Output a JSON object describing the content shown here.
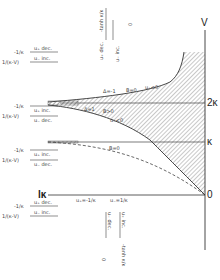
{
  "diagram": {
    "axes": {
      "v_label": "V",
      "tick_2k": "2κ",
      "tick_k": "κ",
      "tick_0": "0",
      "left_label": "lκ"
    },
    "curve_labels": {
      "upper_delta": "Δ=-1",
      "upper_b": "B=0",
      "upper_u": "u₊<0",
      "lower_delta": "Δ=1",
      "lower_b": "B>0",
      "lower_u": "u₋<0",
      "dashed_b": "B=0"
    },
    "baseline_labels": {
      "left": "u₊=-1/κ",
      "right": "u₋=1/κ"
    },
    "left_legends": [
      {
        "top_text": "u₊  dec.",
        "left_top": "-1/κ",
        "bottom_text": "u₋  inc.",
        "left_bottom": "1/(κ-V)"
      },
      {
        "top_text": "u₊  inc.",
        "left_top": "-1/κ",
        "bottom_text": "u₋  dec.",
        "left_bottom": "1/(κ-V)"
      },
      {
        "top_text": "u₊  inc.",
        "left_top": "-1/κ",
        "bottom_text": "u₋  dec.",
        "left_bottom": "1/(κ-V)"
      },
      {
        "top_text": "u₊  dec.",
        "left_top": "-1/κ",
        "bottom_text": "u₋  inc.",
        "left_bottom": "1/(κ-V)"
      }
    ],
    "top_legend": {
      "a": "u₊  dec.",
      "b": "-tanh κ/κ",
      "c": "u₋  inc.",
      "d": "0"
    },
    "bottom_legend": {
      "a": "u₊  inc.",
      "b": "-tanh κ/κ",
      "c": "u₋  dec.",
      "d": "0"
    }
  }
}
